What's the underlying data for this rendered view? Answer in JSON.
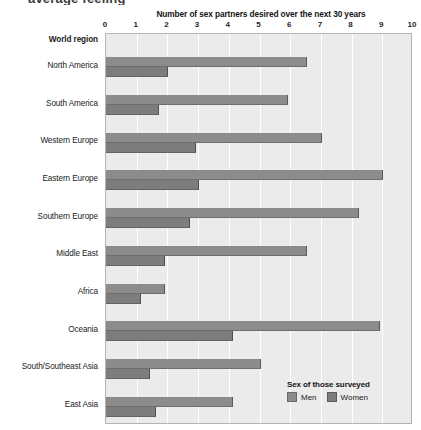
{
  "top_fragment": "average feeling",
  "chart_data": {
    "type": "bar",
    "orientation": "horizontal",
    "title": "Number of sex partners desired over the next 30 years",
    "xlabel": "",
    "ylabel": "World region",
    "axis_header_label": "World region",
    "xlim": [
      0,
      10
    ],
    "xticks": [
      "0",
      "1",
      "2",
      "3",
      "4",
      "5",
      "6",
      "7",
      "8",
      "9",
      "10"
    ],
    "grid": true,
    "legend": {
      "title": "Sex of those surveyed",
      "position": "bottom-right",
      "entries": [
        {
          "name": "Men",
          "color": "#8c8c8c"
        },
        {
          "name": "Women",
          "color": "#7d7d7d"
        }
      ]
    },
    "categories": [
      "North America",
      "South America",
      "Western Europe",
      "Eastern Europe",
      "Southern Europe",
      "Middle East",
      "Africa",
      "Oceania",
      "South/Southeast Asia",
      "East Asia"
    ],
    "series": [
      {
        "name": "Men",
        "color": "#8c8c8c",
        "values": [
          6.5,
          5.9,
          7.0,
          9.0,
          8.2,
          6.5,
          1.9,
          8.9,
          5.0,
          4.1
        ]
      },
      {
        "name": "Women",
        "color": "#7d7d7d",
        "values": [
          2.0,
          1.7,
          2.9,
          3.0,
          2.7,
          1.9,
          1.1,
          4.1,
          1.4,
          1.6
        ]
      }
    ]
  }
}
